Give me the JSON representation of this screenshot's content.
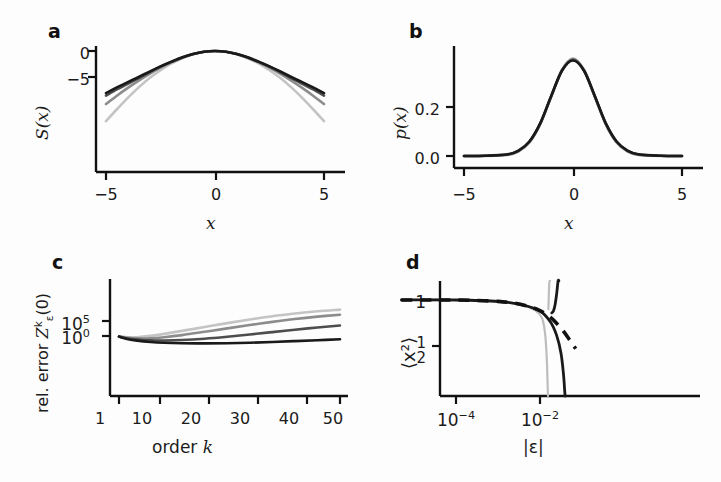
{
  "figure": {
    "background": "#fdfdfd",
    "width": 721,
    "height": 482
  },
  "panels": [
    {
      "id": "a",
      "letter": "a",
      "ylabel": "S(x)",
      "xlabel": "x",
      "yticks": [
        "0",
        "−5"
      ],
      "xticks": [
        "−5",
        "0",
        "5"
      ]
    },
    {
      "id": "b",
      "letter": "b",
      "ylabel": "p(x)",
      "xlabel": "x",
      "yticks": [
        "0.2",
        "0.0"
      ],
      "xticks": [
        "−5",
        "0",
        "5"
      ]
    },
    {
      "id": "c",
      "letter": "c",
      "ylabel_prefix": "rel. error ",
      "ylabel_sym": "Z",
      "ylabel_sup": "k",
      "ylabel_sub": "ε",
      "ylabel_suffix": "(0)",
      "xlabel_prefix": "order ",
      "xlabel_sym": "k",
      "ytick_upper_base": "10",
      "ytick_upper_exp": "5",
      "ytick_lower_base": "10",
      "ytick_lower_exp": "0",
      "xticks": [
        "1",
        "10",
        "20",
        "30",
        "40",
        "50"
      ]
    },
    {
      "id": "d",
      "letter": "d",
      "ylabel": "⟨x²⟩",
      "xlabel": "|ε|",
      "ytick_top": "1",
      "ytick_frac_num": "1",
      "ytick_frac_den": "2",
      "xtick_1_base": "10",
      "xtick_1_exp": "−4",
      "xtick_2_base": "10",
      "xtick_2_exp": "−2"
    }
  ],
  "colors": {
    "axis": "#111111",
    "text": "#1b1b1b",
    "curve_darkest": "#1a1a1a",
    "curve_dark": "#4d4d4d",
    "curve_mid": "#8c8c8c",
    "curve_light": "#c4c4c4"
  },
  "chart_data": [
    {
      "type": "line",
      "panel": "a",
      "title": "",
      "xlabel": "x",
      "ylabel": "S(x)",
      "xlim": [
        -5.8,
        5.8
      ],
      "ylim": [
        -14.0,
        0.8
      ],
      "xticks": [
        -5,
        0,
        5
      ],
      "xticklabels": [
        "−5",
        "0",
        "5"
      ],
      "yticks": [
        0,
        -5
      ],
      "yticklabels": [
        "0",
        "−5"
      ],
      "grid": false,
      "legend": "none",
      "note": "Four log-probability (action) curves S(x); all peak near 0 at x=0 and fall off with different curvatures. Lighter gray = narrower/steeper, darker = broader near edges.",
      "series": [
        {
          "name": "curve-light",
          "color": "#c4c4c4",
          "x": [
            -5.0,
            -4.5,
            -4.0,
            -3.5,
            -3.0,
            -2.5,
            -2.0,
            -1.5,
            -1.0,
            -0.5,
            0.0,
            0.5,
            1.0,
            1.5,
            2.0,
            2.5,
            3.0,
            3.5,
            4.0,
            4.5,
            5.0
          ],
          "y": [
            -13.5,
            -11.2,
            -9.0,
            -7.0,
            -5.2,
            -3.7,
            -2.4,
            -1.4,
            -0.62,
            -0.16,
            0.0,
            -0.16,
            -0.62,
            -1.4,
            -2.4,
            -3.7,
            -5.2,
            -7.0,
            -9.0,
            -11.2,
            -13.5
          ]
        },
        {
          "name": "curve-mid",
          "color": "#8c8c8c",
          "x": [
            -5.0,
            -4.5,
            -4.0,
            -3.5,
            -3.0,
            -2.5,
            -2.0,
            -1.5,
            -1.0,
            -0.5,
            0.0,
            0.5,
            1.0,
            1.5,
            2.0,
            2.5,
            3.0,
            3.5,
            4.0,
            4.5,
            5.0
          ],
          "y": [
            -10.2,
            -8.6,
            -7.1,
            -5.7,
            -4.4,
            -3.2,
            -2.2,
            -1.3,
            -0.6,
            -0.15,
            0.0,
            -0.15,
            -0.6,
            -1.3,
            -2.2,
            -3.2,
            -4.4,
            -5.7,
            -7.1,
            -8.6,
            -10.2
          ]
        },
        {
          "name": "curve-dark",
          "color": "#4d4d4d",
          "x": [
            -5.0,
            -4.5,
            -4.0,
            -3.5,
            -3.0,
            -2.5,
            -2.0,
            -1.5,
            -1.0,
            -0.5,
            0.0,
            0.5,
            1.0,
            1.5,
            2.0,
            2.5,
            3.0,
            3.5,
            4.0,
            4.5,
            5.0
          ],
          "y": [
            -8.6,
            -7.4,
            -6.3,
            -5.2,
            -4.1,
            -3.0,
            -2.1,
            -1.25,
            -0.58,
            -0.15,
            0.0,
            -0.15,
            -0.58,
            -1.25,
            -2.1,
            -3.0,
            -4.1,
            -5.2,
            -6.3,
            -7.4,
            -8.6
          ]
        },
        {
          "name": "curve-darkest",
          "color": "#1a1a1a",
          "x": [
            -5.0,
            -4.5,
            -4.0,
            -3.5,
            -3.0,
            -2.5,
            -2.0,
            -1.5,
            -1.0,
            -0.5,
            0.0,
            0.5,
            1.0,
            1.5,
            2.0,
            2.5,
            3.0,
            3.5,
            4.0,
            4.5,
            5.0
          ],
          "y": [
            -8.1,
            -7.0,
            -6.0,
            -5.0,
            -3.95,
            -2.95,
            -2.05,
            -1.22,
            -0.57,
            -0.145,
            0.0,
            -0.145,
            -0.57,
            -1.22,
            -2.05,
            -2.95,
            -3.95,
            -5.0,
            -6.0,
            -7.0,
            -8.1
          ]
        }
      ]
    },
    {
      "type": "line",
      "panel": "b",
      "title": "",
      "xlabel": "x",
      "ylabel": "p(x)",
      "xlim": [
        -5.8,
        5.8
      ],
      "ylim": [
        0.0,
        0.45
      ],
      "xticks": [
        -5,
        0,
        5
      ],
      "xticklabels": [
        "−5",
        "0",
        "5"
      ],
      "yticks": [
        0.2,
        0.0
      ],
      "yticklabels": [
        "0.2",
        "0.0"
      ],
      "grid": false,
      "legend": "none",
      "note": "Four near-identical unit Gaussian densities overlaid; peak value ~0.40 at x=0, essentially 0 beyond |x|>3.",
      "series": [
        {
          "name": "curve-light",
          "color": "#c4c4c4",
          "x": [
            -5.0,
            -4.0,
            -3.0,
            -2.5,
            -2.0,
            -1.5,
            -1.0,
            -0.5,
            0.0,
            0.5,
            1.0,
            1.5,
            2.0,
            2.5,
            3.0,
            4.0,
            5.0
          ],
          "y": [
            0.0,
            0.0,
            0.004,
            0.018,
            0.054,
            0.13,
            0.242,
            0.352,
            0.399,
            0.352,
            0.242,
            0.13,
            0.054,
            0.018,
            0.004,
            0.0,
            0.0
          ]
        },
        {
          "name": "curve-mid",
          "color": "#8c8c8c",
          "x": [
            -5.0,
            -4.0,
            -3.0,
            -2.5,
            -2.0,
            -1.5,
            -1.0,
            -0.5,
            0.0,
            0.5,
            1.0,
            1.5,
            2.0,
            2.5,
            3.0,
            4.0,
            5.0
          ],
          "y": [
            0.0,
            0.001,
            0.005,
            0.02,
            0.057,
            0.132,
            0.243,
            0.351,
            0.396,
            0.351,
            0.243,
            0.132,
            0.057,
            0.02,
            0.005,
            0.001,
            0.0
          ]
        },
        {
          "name": "curve-dark",
          "color": "#4d4d4d",
          "x": [
            -5.0,
            -4.0,
            -3.0,
            -2.5,
            -2.0,
            -1.5,
            -1.0,
            -0.5,
            0.0,
            0.5,
            1.0,
            1.5,
            2.0,
            2.5,
            3.0,
            4.0,
            5.0
          ],
          "y": [
            0.0,
            0.001,
            0.006,
            0.021,
            0.058,
            0.133,
            0.244,
            0.35,
            0.393,
            0.35,
            0.244,
            0.133,
            0.058,
            0.021,
            0.006,
            0.001,
            0.0
          ]
        },
        {
          "name": "curve-darkest",
          "color": "#1a1a1a",
          "x": [
            -5.0,
            -4.0,
            -3.0,
            -2.5,
            -2.0,
            -1.5,
            -1.0,
            -0.5,
            0.0,
            0.5,
            1.0,
            1.5,
            2.0,
            2.5,
            3.0,
            4.0,
            5.0
          ],
          "y": [
            0.0,
            0.001,
            0.007,
            0.022,
            0.059,
            0.134,
            0.245,
            0.349,
            0.39,
            0.349,
            0.245,
            0.134,
            0.059,
            0.022,
            0.007,
            0.001,
            0.0
          ]
        }
      ]
    },
    {
      "type": "line",
      "panel": "c",
      "title": "",
      "xlabel": "order k",
      "ylabel": "rel. error Z_ε^k(0)",
      "xlim": [
        0,
        52
      ],
      "ylim_log10": [
        -2.5,
        9.0
      ],
      "xticks": [
        1,
        10,
        20,
        30,
        40,
        50
      ],
      "xticklabels": [
        "1",
        "10",
        "20",
        "30",
        "40",
        "50"
      ],
      "yticks_log10": [
        5,
        0
      ],
      "yticklabels": [
        "10^5",
        "10^0"
      ],
      "yscale": "log",
      "grid": false,
      "legend": "none",
      "note": "Four asymptotic-series error curves vs truncation order k. All coincide near k=1 at ~10^0, dip to a minimum, then diverge; lighter gray diverges earliest/fastest.",
      "series": [
        {
          "name": "curve-light",
          "color": "#c4c4c4",
          "x": [
            1,
            3,
            5,
            8,
            11,
            15,
            20,
            25,
            30,
            35,
            40,
            45,
            50
          ],
          "y_log10": [
            -0.15,
            -0.45,
            -0.4,
            0.05,
            0.7,
            1.7,
            3.0,
            4.3,
            5.5,
            6.6,
            7.5,
            8.25,
            8.8
          ]
        },
        {
          "name": "curve-mid",
          "color": "#8c8c8c",
          "x": [
            1,
            3,
            5,
            8,
            11,
            15,
            20,
            25,
            30,
            35,
            40,
            45,
            50
          ],
          "y_log10": [
            -0.15,
            -0.6,
            -0.8,
            -0.75,
            -0.4,
            0.3,
            1.4,
            2.55,
            3.65,
            4.7,
            5.65,
            6.45,
            7.1
          ]
        },
        {
          "name": "curve-dark",
          "color": "#4d4d4d",
          "x": [
            1,
            3,
            5,
            8,
            11,
            15,
            20,
            25,
            30,
            35,
            40,
            45,
            50
          ],
          "y_log10": [
            -0.18,
            -0.85,
            -1.2,
            -1.45,
            -1.5,
            -1.35,
            -0.9,
            -0.25,
            0.5,
            1.3,
            2.1,
            2.85,
            3.5
          ]
        },
        {
          "name": "curve-darkest",
          "color": "#1a1a1a",
          "x": [
            1,
            3,
            5,
            8,
            11,
            15,
            20,
            25,
            30,
            35,
            40,
            45,
            50
          ],
          "y_log10": [
            -0.2,
            -1.05,
            -1.55,
            -2.0,
            -2.25,
            -2.4,
            -2.45,
            -2.4,
            -2.25,
            -2.0,
            -1.7,
            -1.4,
            -1.1
          ]
        }
      ]
    },
    {
      "type": "line",
      "panel": "d",
      "title": "",
      "xlabel": "|ε|",
      "ylabel": "⟨x²⟩",
      "xscale": "log",
      "xlim_log10": [
        -5.6,
        -1.0
      ],
      "ylim": [
        -0.1,
        1.35
      ],
      "xticks_log10": [
        -4,
        -2
      ],
      "xticklabels": [
        "10^-4",
        "10^-2"
      ],
      "yticks": [
        1.0,
        0.5
      ],
      "yticklabels": [
        "1",
        "1/2"
      ],
      "grid": false,
      "legend": "none",
      "note": "Second moment ⟨x²⟩ versus perturbation magnitude |ε|. Thick dashed black is the reference/exact result decaying smoothly; solid gray and black curves track it then break away with near-vertical asymptotes at |ε| ~ 10^-1.6 and 10^-1.35.",
      "series": [
        {
          "name": "reference-dashed",
          "color": "#111111",
          "style": "dashed",
          "x_log10": [
            -5.3,
            -5.0,
            -4.5,
            -4.0,
            -3.5,
            -3.0,
            -2.6,
            -2.3,
            -2.1,
            -1.9,
            -1.75,
            -1.6,
            -1.45,
            -1.3,
            -1.15
          ],
          "y": [
            1.0,
            1.0,
            1.0,
            1.0,
            0.995,
            0.985,
            0.965,
            0.935,
            0.905,
            0.86,
            0.81,
            0.745,
            0.665,
            0.57,
            0.47
          ]
        },
        {
          "name": "curve-light-divergent",
          "color": "#bdbdbd",
          "style": "solid",
          "x_log10": [
            -5.3,
            -4.0,
            -3.0,
            -2.4,
            -2.1,
            -1.95,
            -1.88,
            -1.84,
            -1.82,
            -1.81
          ],
          "y": [
            1.0,
            1.0,
            0.985,
            0.945,
            0.885,
            0.8,
            0.64,
            0.38,
            0.1,
            -0.1
          ]
        },
        {
          "name": "curve-light-upper-branch",
          "color": "#bdbdbd",
          "style": "solid",
          "x_log10": [
            -1.8,
            -1.79,
            -1.78,
            -1.77,
            -1.76
          ],
          "y": [
            0.9,
            1.05,
            1.18,
            1.27,
            1.33
          ]
        },
        {
          "name": "curve-dark-divergent",
          "color": "#1a1a1a",
          "style": "solid",
          "x_log10": [
            -5.3,
            -4.0,
            -3.0,
            -2.4,
            -2.0,
            -1.75,
            -1.6,
            -1.5,
            -1.44,
            -1.41,
            -1.4
          ],
          "y": [
            1.0,
            1.0,
            0.985,
            0.945,
            0.88,
            0.76,
            0.61,
            0.42,
            0.19,
            0.0,
            -0.1
          ]
        },
        {
          "name": "curve-dark-upper-branch",
          "color": "#1a1a1a",
          "style": "solid",
          "x_log10": [
            -1.72,
            -1.68,
            -1.64,
            -1.6,
            -1.57,
            -1.55
          ],
          "y": [
            0.86,
            0.88,
            0.95,
            1.08,
            1.22,
            1.33
          ]
        }
      ]
    }
  ]
}
